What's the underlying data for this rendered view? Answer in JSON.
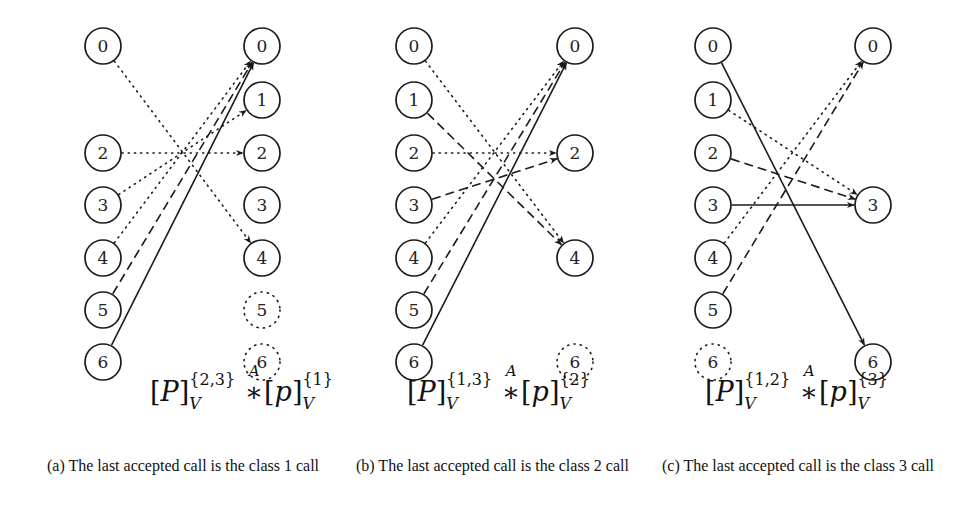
{
  "figure": {
    "panels": [
      {
        "id": "a",
        "left_x": 103,
        "right_x": 262,
        "left_nodes": [
          {
            "label": "0",
            "row": 0,
            "style": "solid"
          },
          {
            "label": "2",
            "row": 2,
            "style": "solid"
          },
          {
            "label": "3",
            "row": 3,
            "style": "solid"
          },
          {
            "label": "4",
            "row": 4,
            "style": "solid"
          },
          {
            "label": "5",
            "row": 5,
            "style": "solid"
          },
          {
            "label": "6",
            "row": 6,
            "style": "solid"
          }
        ],
        "right_nodes": [
          {
            "label": "0",
            "row": 0,
            "style": "solid"
          },
          {
            "label": "1",
            "row": 1,
            "style": "solid"
          },
          {
            "label": "2",
            "row": 2,
            "style": "solid"
          },
          {
            "label": "3",
            "row": 3,
            "style": "solid"
          },
          {
            "label": "4",
            "row": 4,
            "style": "solid"
          },
          {
            "label": "5",
            "row": 5,
            "style": "dotted"
          },
          {
            "label": "6",
            "row": 6,
            "style": "dotted"
          }
        ],
        "edges": [
          {
            "from": 0,
            "to": 4,
            "style": "dotted"
          },
          {
            "from": 2,
            "to": 2,
            "style": "dotted"
          },
          {
            "from": 3,
            "to": 1,
            "style": "dotted"
          },
          {
            "from": 4,
            "to": 0,
            "style": "dotted"
          },
          {
            "from": 5,
            "to": 0,
            "style": "dashed"
          },
          {
            "from": 6,
            "to": 0,
            "style": "solid"
          }
        ],
        "formula": {
          "left_sup": "{2,3}",
          "left_sub": "V",
          "op_over": "A",
          "right_sup": "{1}",
          "right_sub": "V",
          "P": "P",
          "p": "p",
          "star": "∗"
        },
        "caption": "(a) The last accepted call is the class 1 call"
      },
      {
        "id": "b",
        "left_x": 414,
        "right_x": 575,
        "left_nodes": [
          {
            "label": "0",
            "row": 0,
            "style": "solid"
          },
          {
            "label": "1",
            "row": 1,
            "style": "solid"
          },
          {
            "label": "2",
            "row": 2,
            "style": "solid"
          },
          {
            "label": "3",
            "row": 3,
            "style": "solid"
          },
          {
            "label": "4",
            "row": 4,
            "style": "solid"
          },
          {
            "label": "5",
            "row": 5,
            "style": "solid"
          },
          {
            "label": "6",
            "row": 6,
            "style": "solid"
          }
        ],
        "right_nodes": [
          {
            "label": "0",
            "row": 0,
            "style": "solid"
          },
          {
            "label": "2",
            "row": 2,
            "style": "solid"
          },
          {
            "label": "4",
            "row": 4,
            "style": "solid"
          },
          {
            "label": "6",
            "row": 6,
            "style": "dotted"
          }
        ],
        "edges": [
          {
            "from": 0,
            "to": 4,
            "style": "dotted"
          },
          {
            "from": 1,
            "to": 4,
            "style": "dashed"
          },
          {
            "from": 2,
            "to": 2,
            "style": "dotted"
          },
          {
            "from": 3,
            "to": 2,
            "style": "dashed"
          },
          {
            "from": 4,
            "to": 0,
            "style": "dotted"
          },
          {
            "from": 5,
            "to": 0,
            "style": "dashed"
          },
          {
            "from": 6,
            "to": 0,
            "style": "solid"
          }
        ],
        "formula": {
          "left_sup": "{1,3}",
          "left_sub": "V",
          "op_over": "A",
          "right_sup": "{2}",
          "right_sub": "V",
          "P": "P",
          "p": "p",
          "star": "∗"
        },
        "caption": "(b) The last accepted call is the class 2 call"
      },
      {
        "id": "c",
        "left_x": 713,
        "right_x": 873,
        "left_nodes": [
          {
            "label": "0",
            "row": 0,
            "style": "solid"
          },
          {
            "label": "1",
            "row": 1,
            "style": "solid"
          },
          {
            "label": "2",
            "row": 2,
            "style": "solid"
          },
          {
            "label": "3",
            "row": 3,
            "style": "solid"
          },
          {
            "label": "4",
            "row": 4,
            "style": "solid"
          },
          {
            "label": "5",
            "row": 5,
            "style": "solid"
          },
          {
            "label": "6",
            "row": 6,
            "style": "dotted"
          }
        ],
        "right_nodes": [
          {
            "label": "0",
            "row": 0,
            "style": "solid"
          },
          {
            "label": "3",
            "row": 3,
            "style": "solid"
          },
          {
            "label": "6",
            "row": 6,
            "style": "solid"
          }
        ],
        "edges": [
          {
            "from": 0,
            "to": 6,
            "style": "solid"
          },
          {
            "from": 1,
            "to": 3,
            "style": "dotted"
          },
          {
            "from": 2,
            "to": 3,
            "style": "dashed"
          },
          {
            "from": 3,
            "to": 3,
            "style": "solid"
          },
          {
            "from": 4,
            "to": 0,
            "style": "dotted"
          },
          {
            "from": 5,
            "to": 0,
            "style": "dashed"
          }
        ],
        "formula": {
          "left_sup": "{1,2}",
          "left_sub": "V",
          "op_over": "A",
          "right_sup": "{3}",
          "right_sub": "V",
          "P": "P",
          "p": "p",
          "star": "∗"
        },
        "caption": "(c) The last accepted call is the class 3 call"
      }
    ],
    "row_y": [
      46,
      100,
      153,
      205,
      258,
      310,
      362
    ],
    "node_radius": 18,
    "stroke_color": "#1a1a1a"
  }
}
